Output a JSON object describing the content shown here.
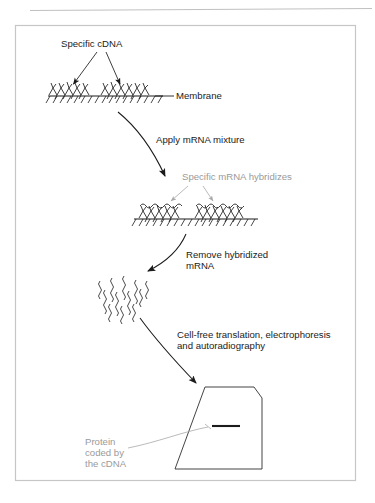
{
  "page": {
    "header_strip_text": "",
    "frame": {
      "x": 15,
      "y": 25,
      "w": 341,
      "h": 456,
      "border_color": "#c6c6c6",
      "background": "#ffffff"
    }
  },
  "colors": {
    "ink": "#1b1b1b",
    "gray_label": "#9a9a9a",
    "leader_gray": "#a8a8a8",
    "frame_border": "#c6c6c6",
    "rule": "#b9b9b9"
  },
  "diagram": {
    "type": "process-flow",
    "labels": {
      "specific_cdna": "Specific cDNA",
      "membrane": "Membrane",
      "apply_mrna": "Apply mRNA mixture",
      "specific_mrna_hybridizes": "Specific mRNA hybridizes",
      "remove_hybridized_line1": "Remove hybridized",
      "remove_hybridized_line2": "mRNA",
      "cellfree_line1": "Cell-free translation, electrophoresis",
      "cellfree_line2": "and autoradiography",
      "protein_line1": "Protein",
      "protein_line2": "coded by",
      "protein_line3": "the cDNA"
    },
    "steps": [
      {
        "id": "step-1",
        "name": "cdna-bound-membrane",
        "caption": "Specific cDNA bound to membrane"
      },
      {
        "id": "step-2",
        "name": "apply-mrna-mixture",
        "caption": "Apply mRNA mixture"
      },
      {
        "id": "step-3",
        "name": "mrna-hybridized-membrane",
        "caption": "Specific mRNA hybridizes"
      },
      {
        "id": "step-4",
        "name": "released-mrna-pool",
        "caption": "Remove hybridized mRNA"
      },
      {
        "id": "step-5",
        "name": "gel-autoradiograph",
        "caption": "Cell-free translation, electrophoresis and autoradiography"
      }
    ],
    "gel": {
      "band_label": "Protein coded by the cDNA"
    }
  }
}
